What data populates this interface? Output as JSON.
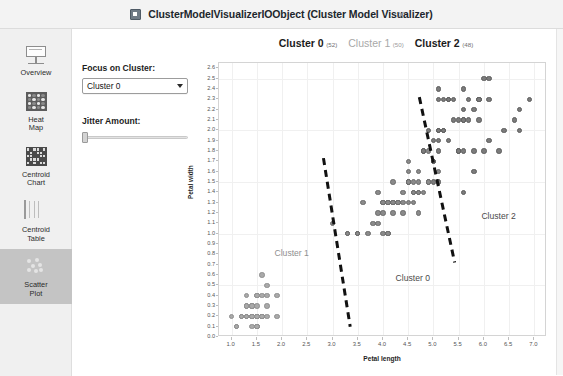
{
  "window": {
    "title": "ClusterModelVisualizerIOObject (Cluster Model Visualizer)",
    "icon": "app-window-icon",
    "close_label": "×"
  },
  "sidebar": {
    "items": [
      {
        "id": "overview",
        "label": "Overview",
        "icon": "overview-icon",
        "selected": false
      },
      {
        "id": "heat-map",
        "label": "Heat\nMap",
        "icon": "heat-map-icon",
        "selected": false
      },
      {
        "id": "centroid-chart",
        "label": "Centroid\nChart",
        "icon": "centroid-chart-icon",
        "selected": false
      },
      {
        "id": "centroid-table",
        "label": "Centroid\nTable",
        "icon": "centroid-table-icon",
        "selected": false
      },
      {
        "id": "scatter-plot",
        "label": "Scatter\nPlot",
        "icon": "scatter-plot-icon",
        "selected": true
      }
    ]
  },
  "controls": {
    "focus_label": "Focus on Cluster:",
    "focus_value": "Cluster 0",
    "focus_options": [
      "Cluster 0",
      "Cluster 1",
      "Cluster 2"
    ],
    "jitter_label": "Jitter Amount:",
    "jitter_value": 0
  },
  "chart_data": {
    "type": "scatter",
    "title": "",
    "xlabel": "Petal length",
    "ylabel": "Petal width",
    "xlim": [
      0.75,
      7.25
    ],
    "ylim": [
      0.0,
      2.65
    ],
    "xticks": [
      "1.0",
      "1.5",
      "2.0",
      "2.5",
      "3.0",
      "3.5",
      "4.0",
      "4.5",
      "5.0",
      "5.5",
      "6.0",
      "6.5",
      "7.0"
    ],
    "xtick_values": [
      1.0,
      1.5,
      2.0,
      2.5,
      3.0,
      3.5,
      4.0,
      4.5,
      5.0,
      5.5,
      6.0,
      6.5,
      7.0
    ],
    "yticks": [
      "0.0",
      "0.1",
      "0.2",
      "0.3",
      "0.4",
      "0.5",
      "0.6",
      "0.7",
      "0.8",
      "0.9",
      "1.0",
      "1.1",
      "1.2",
      "1.3",
      "1.4",
      "1.5",
      "1.6",
      "1.7",
      "1.8",
      "1.9",
      "2.0",
      "2.1",
      "2.2",
      "2.3",
      "2.4",
      "2.5",
      "2.6"
    ],
    "ytick_values": [
      0.0,
      0.1,
      0.2,
      0.3,
      0.4,
      0.5,
      0.6,
      0.7,
      0.8,
      0.9,
      1.0,
      1.1,
      1.2,
      1.3,
      1.4,
      1.5,
      1.6,
      1.7,
      1.8,
      1.9,
      2.0,
      2.1,
      2.2,
      2.3,
      2.4,
      2.5,
      2.6
    ],
    "grid": true,
    "legend_position": "top-center",
    "legend": [
      {
        "name": "Cluster 0",
        "count": "(52)",
        "emphasis": "bold",
        "color": "#8a8a8a"
      },
      {
        "name": "Cluster 1",
        "count": "(50)",
        "emphasis": "muted",
        "color": "#a9a9a9"
      },
      {
        "name": "Cluster 2",
        "count": "(48)",
        "emphasis": "bold",
        "color": "#7b7b7b"
      }
    ],
    "annotations": [
      {
        "text": "Cluster 1",
        "x": 1.85,
        "y": 0.86,
        "style": "light"
      },
      {
        "text": "Cluster 0",
        "x": 4.25,
        "y": 0.62,
        "style": "dark"
      },
      {
        "text": "Cluster 2",
        "x": 5.95,
        "y": 1.22,
        "style": "dark"
      }
    ],
    "boundaries": [
      {
        "name": "cluster1-cluster0-boundary",
        "x1": 2.82,
        "y1": 1.73,
        "x2": 3.35,
        "y2": 0.1
      },
      {
        "name": "cluster0-cluster2-boundary",
        "x1": 4.72,
        "y1": 2.32,
        "x2": 5.42,
        "y2": 0.72
      }
    ],
    "series": [
      {
        "name": "Cluster 1",
        "class": "c1",
        "points": [
          [
            1.0,
            0.2
          ],
          [
            1.1,
            0.1
          ],
          [
            1.2,
            0.2
          ],
          [
            1.2,
            0.2
          ],
          [
            1.3,
            0.2
          ],
          [
            1.3,
            0.2
          ],
          [
            1.3,
            0.3
          ],
          [
            1.3,
            0.4
          ],
          [
            1.4,
            0.1
          ],
          [
            1.4,
            0.2
          ],
          [
            1.4,
            0.2
          ],
          [
            1.4,
            0.2
          ],
          [
            1.4,
            0.3
          ],
          [
            1.4,
            0.3
          ],
          [
            1.5,
            0.1
          ],
          [
            1.5,
            0.1
          ],
          [
            1.5,
            0.2
          ],
          [
            1.5,
            0.2
          ],
          [
            1.5,
            0.2
          ],
          [
            1.5,
            0.3
          ],
          [
            1.5,
            0.4
          ],
          [
            1.5,
            0.4
          ],
          [
            1.6,
            0.2
          ],
          [
            1.6,
            0.2
          ],
          [
            1.6,
            0.2
          ],
          [
            1.6,
            0.4
          ],
          [
            1.6,
            0.6
          ],
          [
            1.7,
            0.2
          ],
          [
            1.7,
            0.3
          ],
          [
            1.7,
            0.4
          ],
          [
            1.7,
            0.5
          ],
          [
            1.9,
            0.2
          ],
          [
            1.9,
            0.4
          ],
          [
            1.4,
            0.2
          ],
          [
            1.5,
            0.2
          ],
          [
            1.6,
            0.2
          ],
          [
            1.4,
            0.3
          ],
          [
            1.3,
            0.2
          ],
          [
            1.5,
            0.2
          ],
          [
            1.4,
            0.2
          ],
          [
            1.5,
            0.2
          ],
          [
            1.3,
            0.2
          ],
          [
            1.6,
            0.2
          ],
          [
            1.4,
            0.2
          ],
          [
            1.1,
            0.1
          ],
          [
            1.2,
            0.2
          ],
          [
            1.5,
            0.1
          ],
          [
            1.3,
            0.3
          ],
          [
            1.4,
            0.2
          ],
          [
            1.5,
            0.2
          ]
        ]
      },
      {
        "name": "Cluster 0",
        "class": "c0",
        "points": [
          [
            3.0,
            1.1
          ],
          [
            3.3,
            1.0
          ],
          [
            3.3,
            1.0
          ],
          [
            3.5,
            1.0
          ],
          [
            3.5,
            1.0
          ],
          [
            3.6,
            1.3
          ],
          [
            3.7,
            1.0
          ],
          [
            3.8,
            1.1
          ],
          [
            3.9,
            1.2
          ],
          [
            3.9,
            1.4
          ],
          [
            4.0,
            1.0
          ],
          [
            4.0,
            1.3
          ],
          [
            4.0,
            1.3
          ],
          [
            4.1,
            1.0
          ],
          [
            4.1,
            1.3
          ],
          [
            4.1,
            1.3
          ],
          [
            4.2,
            1.2
          ],
          [
            4.2,
            1.3
          ],
          [
            4.2,
            1.3
          ],
          [
            4.2,
            1.5
          ],
          [
            4.3,
            1.3
          ],
          [
            4.4,
            1.2
          ],
          [
            4.4,
            1.3
          ],
          [
            4.4,
            1.4
          ],
          [
            4.5,
            1.3
          ],
          [
            4.5,
            1.5
          ],
          [
            4.5,
            1.5
          ],
          [
            4.5,
            1.5
          ],
          [
            4.5,
            1.6
          ],
          [
            4.5,
            1.7
          ],
          [
            4.6,
            1.3
          ],
          [
            4.6,
            1.4
          ],
          [
            4.6,
            1.4
          ],
          [
            4.6,
            1.5
          ],
          [
            4.7,
            1.2
          ],
          [
            4.7,
            1.4
          ],
          [
            4.7,
            1.4
          ],
          [
            4.7,
            1.6
          ],
          [
            4.8,
            1.4
          ],
          [
            4.8,
            1.8
          ],
          [
            4.9,
            1.5
          ],
          [
            4.9,
            1.5
          ],
          [
            4.9,
            1.8
          ],
          [
            5.0,
            1.7
          ],
          [
            5.1,
            1.6
          ],
          [
            3.5,
            1.0
          ],
          [
            3.9,
            1.1
          ],
          [
            4.0,
            1.2
          ],
          [
            4.3,
            1.3
          ],
          [
            4.1,
            1.0
          ],
          [
            4.7,
            1.5
          ],
          [
            4.5,
            1.5
          ]
        ]
      },
      {
        "name": "Cluster 2",
        "class": "c2",
        "points": [
          [
            4.8,
            1.8
          ],
          [
            4.9,
            2.0
          ],
          [
            5.0,
            1.5
          ],
          [
            5.0,
            1.7
          ],
          [
            5.1,
            1.5
          ],
          [
            5.1,
            1.8
          ],
          [
            5.1,
            1.9
          ],
          [
            5.1,
            2.0
          ],
          [
            5.1,
            2.3
          ],
          [
            5.1,
            2.4
          ],
          [
            5.2,
            2.0
          ],
          [
            5.2,
            2.3
          ],
          [
            5.3,
            1.9
          ],
          [
            5.3,
            2.3
          ],
          [
            5.4,
            2.1
          ],
          [
            5.4,
            2.3
          ],
          [
            5.5,
            1.8
          ],
          [
            5.5,
            2.1
          ],
          [
            5.6,
            1.4
          ],
          [
            5.6,
            1.8
          ],
          [
            5.6,
            2.1
          ],
          [
            5.6,
            2.2
          ],
          [
            5.6,
            2.4
          ],
          [
            5.7,
            2.1
          ],
          [
            5.7,
            2.3
          ],
          [
            5.8,
            1.6
          ],
          [
            5.8,
            1.8
          ],
          [
            5.8,
            2.2
          ],
          [
            5.9,
            2.1
          ],
          [
            5.9,
            2.3
          ],
          [
            6.0,
            1.8
          ],
          [
            6.0,
            2.5
          ],
          [
            6.1,
            1.9
          ],
          [
            6.1,
            2.3
          ],
          [
            6.1,
            2.5
          ],
          [
            6.3,
            1.8
          ],
          [
            6.4,
            2.0
          ],
          [
            6.6,
            2.1
          ],
          [
            6.7,
            2.0
          ],
          [
            6.7,
            2.2
          ],
          [
            6.9,
            2.3
          ],
          [
            5.0,
            1.9
          ],
          [
            5.2,
            2.0
          ],
          [
            5.1,
            2.0
          ],
          [
            5.3,
            2.3
          ],
          [
            5.5,
            1.8
          ],
          [
            5.6,
            2.1
          ],
          [
            5.9,
            2.3
          ]
        ]
      }
    ]
  }
}
